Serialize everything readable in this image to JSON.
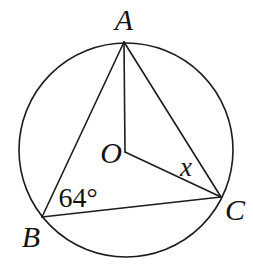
{
  "figure": {
    "canvas": {
      "width": 253,
      "height": 273,
      "background": "#ffffff"
    },
    "stroke_color": "#1c1c1c",
    "stroke_width": 1.6,
    "circle": {
      "name": "circumcircle",
      "cx": 126,
      "cy": 150,
      "r": 107
    },
    "points": {
      "A": {
        "x": 124,
        "y": 42
      },
      "B": {
        "x": 42,
        "y": 217
      },
      "C": {
        "x": 221,
        "y": 197
      },
      "O": {
        "x": 125,
        "y": 152
      }
    },
    "segments": [
      {
        "name": "segment-AB",
        "from": "A",
        "to": "B"
      },
      {
        "name": "segment-AC",
        "from": "A",
        "to": "C"
      },
      {
        "name": "segment-BC",
        "from": "B",
        "to": "C"
      },
      {
        "name": "segment-OA",
        "from": "O",
        "to": "A"
      },
      {
        "name": "segment-OC",
        "from": "O",
        "to": "C"
      }
    ],
    "labels": [
      {
        "name": "label-point-A",
        "text": "A",
        "x": 124,
        "y": 30,
        "italic": true,
        "size": 30
      },
      {
        "name": "label-point-B",
        "text": "B",
        "x": 31,
        "y": 247,
        "italic": true,
        "size": 30
      },
      {
        "name": "label-point-C",
        "text": "C",
        "x": 235,
        "y": 220,
        "italic": true,
        "size": 30
      },
      {
        "name": "label-center-O",
        "text": "O",
        "x": 111,
        "y": 163,
        "italic": true,
        "size": 30
      },
      {
        "name": "label-angle-x",
        "text": "x",
        "x": 186,
        "y": 176,
        "italic": true,
        "size": 27
      },
      {
        "name": "label-angle-B",
        "text": "64°",
        "x": 78,
        "y": 207,
        "italic": false,
        "size": 28
      }
    ]
  }
}
